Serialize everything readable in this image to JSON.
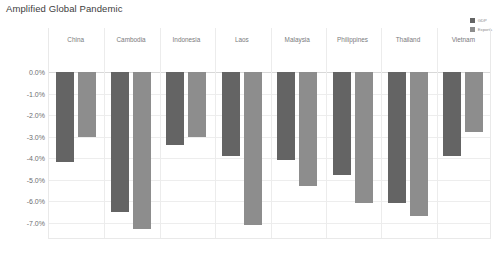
{
  "chart_data": {
    "type": "bar",
    "title": "Amplified Global Pandemic",
    "xlabel": "",
    "ylabel": "",
    "ylim": [
      -7.5,
      0.0
    ],
    "ytick_labels": [
      "0.0%",
      "-1.0%",
      "-2.0%",
      "-3.0%",
      "-4.0%",
      "-5.0%",
      "-6.0%",
      "-7.0%"
    ],
    "ytick_values": [
      0.0,
      -1.0,
      -2.0,
      -3.0,
      -4.0,
      -5.0,
      -6.0,
      -7.0
    ],
    "grid": true,
    "legend_position": "top-right",
    "categories": [
      "China",
      "Cambodia",
      "Indonesia",
      "Laos",
      "Malaysia",
      "Philippines",
      "Thailand",
      "Vietnam"
    ],
    "series": [
      {
        "name": "GDP",
        "color": "#646464",
        "values": [
          -4.2,
          -6.5,
          -3.4,
          -3.9,
          -4.1,
          -4.8,
          -6.1,
          -3.9
        ]
      },
      {
        "name": "Exports",
        "color": "#8d8d8d",
        "values": [
          -3.0,
          -7.3,
          -3.0,
          -7.1,
          -5.3,
          -6.1,
          -6.7,
          -2.8
        ]
      }
    ]
  }
}
